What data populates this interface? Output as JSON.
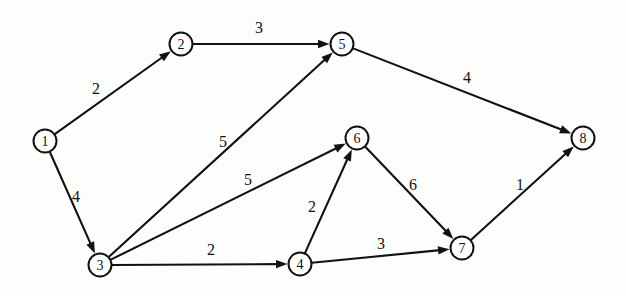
{
  "diagram": {
    "type": "weighted-directed-graph",
    "title": "",
    "background_color": "#fdfdfc",
    "line_color": "#111111",
    "node_fill_color": "#ffffff",
    "node_radius": 11.5,
    "width": 626,
    "height": 296
  },
  "nodes": [
    {
      "id": "1",
      "label": "1",
      "x": 45,
      "y": 141
    },
    {
      "id": "2",
      "label": "2",
      "x": 181,
      "y": 44
    },
    {
      "id": "3",
      "label": "3",
      "x": 100,
      "y": 265
    },
    {
      "id": "4",
      "label": "4",
      "x": 300,
      "y": 264
    },
    {
      "id": "5",
      "label": "5",
      "x": 342,
      "y": 44
    },
    {
      "id": "6",
      "label": "6",
      "x": 357,
      "y": 138
    },
    {
      "id": "7",
      "label": "7",
      "x": 462,
      "y": 248
    },
    {
      "id": "8",
      "label": "8",
      "x": 583,
      "y": 138
    }
  ],
  "edges": [
    {
      "from": "1",
      "to": "2",
      "weight": "2",
      "label_x": 96,
      "label_y": 88
    },
    {
      "from": "1",
      "to": "3",
      "weight": "4",
      "label_x": 76,
      "label_y": 196
    },
    {
      "from": "2",
      "to": "5",
      "weight": "3",
      "label_x": 259,
      "label_y": 27
    },
    {
      "from": "3",
      "to": "5",
      "weight": "5",
      "label_x": 223,
      "label_y": 141
    },
    {
      "from": "3",
      "to": "6",
      "weight": "5",
      "label_x": 248,
      "label_y": 179
    },
    {
      "from": "3",
      "to": "4",
      "weight": "2",
      "label_x": 211,
      "label_y": 249
    },
    {
      "from": "4",
      "to": "6",
      "weight": "2",
      "label_x": 312,
      "label_y": 206
    },
    {
      "from": "4",
      "to": "7",
      "weight": "3",
      "label_x": 381,
      "label_y": 243
    },
    {
      "from": "5",
      "to": "8",
      "weight": "4",
      "label_x": 467,
      "label_y": 77
    },
    {
      "from": "6",
      "to": "7",
      "weight": "6",
      "label_x": 413,
      "label_y": 184
    },
    {
      "from": "7",
      "to": "8",
      "weight": "1",
      "label_x": 520,
      "label_y": 184
    }
  ]
}
